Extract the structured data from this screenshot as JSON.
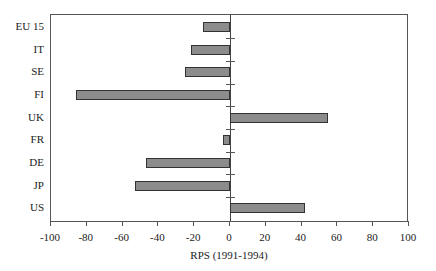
{
  "chart_data": {
    "type": "bar",
    "orientation": "horizontal",
    "title": "",
    "xlabel": "RPS (1991-1994)",
    "ylabel": "",
    "xlim": [
      -100,
      100
    ],
    "xticks": [
      "-100",
      "-80",
      "-60",
      "-40",
      "-20",
      "0",
      "20",
      "40",
      "60",
      "80",
      "100"
    ],
    "categories": [
      "EU 15",
      "IT",
      "SE",
      "FI",
      "UK",
      "FR",
      "DE",
      "JP",
      "US"
    ],
    "values": [
      -15,
      -22,
      -25,
      -86,
      55,
      -4,
      -47,
      -53,
      42
    ],
    "bar_color": "#8c8c8c",
    "grid": false,
    "legend": null
  }
}
